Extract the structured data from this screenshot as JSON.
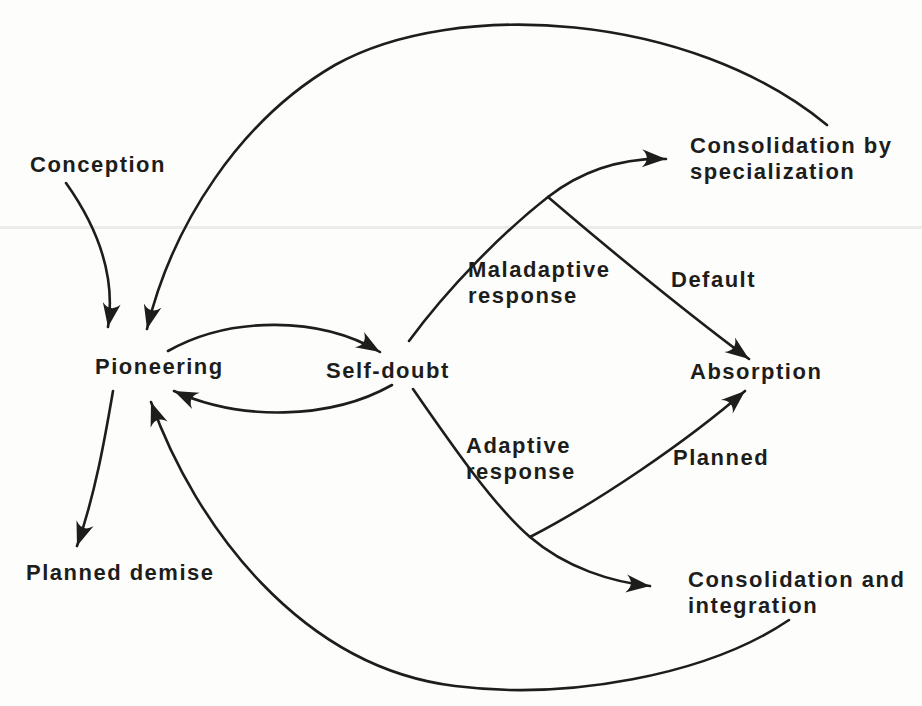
{
  "figure": {
    "type": "flow-diagram",
    "background_color": "#fdfdfc",
    "ink_color": "#1d1d1b",
    "artifact_line_color": "#ececea",
    "nodes": [
      {
        "id": "conception",
        "label": "Conception"
      },
      {
        "id": "pioneering",
        "label": "Pioneering"
      },
      {
        "id": "self-doubt",
        "label": "Self-doubt"
      },
      {
        "id": "maladaptive-response",
        "label": "Maladaptive\nresponse"
      },
      {
        "id": "consolidation-by-specialization",
        "label": "Consolidation by\nspecialization"
      },
      {
        "id": "default",
        "label": "Default"
      },
      {
        "id": "absorption",
        "label": "Absorption"
      },
      {
        "id": "adaptive-response",
        "label": "Adaptive\nresponse"
      },
      {
        "id": "planned",
        "label": "Planned"
      },
      {
        "id": "consolidation-and-integration",
        "label": "Consolidation and\nintegration"
      },
      {
        "id": "planned-demise",
        "label": "Planned demise"
      }
    ],
    "edges": [
      {
        "from": "Conception",
        "to": "Pioneering"
      },
      {
        "from": "Pioneering",
        "to": "Self-doubt"
      },
      {
        "from": "Self-doubt",
        "to": "Pioneering"
      },
      {
        "from": "Self-doubt",
        "to": "Consolidation by specialization",
        "via": "Maladaptive response"
      },
      {
        "from": "Self-doubt",
        "to": "Absorption",
        "via": "Maladaptive response",
        "label": "Default"
      },
      {
        "from": "Self-doubt",
        "to": "Consolidation and integration",
        "via": "Adaptive response"
      },
      {
        "from": "Self-doubt",
        "to": "Absorption",
        "via": "Adaptive response",
        "label": "Planned"
      },
      {
        "from": "Pioneering",
        "to": "Planned demise"
      },
      {
        "from": "Consolidation by specialization",
        "to": "Pioneering"
      },
      {
        "from": "Consolidation and integration",
        "to": "Pioneering"
      }
    ]
  }
}
